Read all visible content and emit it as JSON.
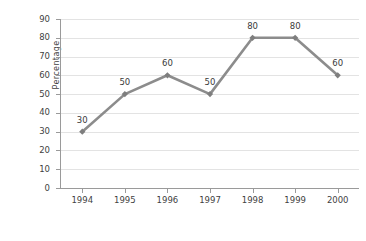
{
  "chart_data": {
    "type": "line",
    "title": "",
    "xlabel": "Years",
    "ylabel": "Percentage",
    "categories": [
      "1994",
      "1995",
      "1996",
      "1997",
      "1998",
      "1999",
      "2000"
    ],
    "values": [
      30,
      50,
      60,
      50,
      80,
      80,
      60
    ],
    "point_labels": [
      "30",
      "50",
      "60",
      "50",
      "80",
      "80",
      "60"
    ],
    "ylim": [
      0,
      90
    ],
    "ytick_labels": [
      "0",
      "10",
      "20",
      "30",
      "40",
      "50",
      "60",
      "70",
      "80",
      "90"
    ],
    "ytick_values": [
      0,
      10,
      20,
      30,
      40,
      50,
      60,
      70,
      80,
      90
    ],
    "grid": "horizontal",
    "legend": "none",
    "series": [
      {
        "name": "Percentage",
        "values": [
          30,
          50,
          60,
          50,
          80,
          80,
          60
        ],
        "color": "#8c8c8c",
        "marker": "diamond"
      }
    ]
  },
  "colors": {
    "series_line": "#8c8c8c",
    "marker": "#7e7e7e",
    "gridline": "#e3e3e3",
    "axis": "#9a9a9a",
    "text": "#3f3f3f",
    "background": "#ffffff"
  }
}
